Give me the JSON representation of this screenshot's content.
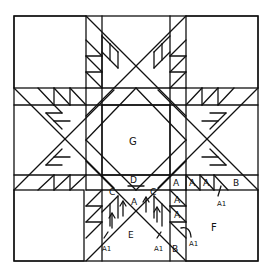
{
  "diagram": {
    "stroke_color": "#111111",
    "background": "#ffffff",
    "labels": {
      "center": "G",
      "top_triangle": "D",
      "left_c": "C",
      "right_c": "C",
      "center_a": "A",
      "e": "E",
      "f": "F",
      "row_a1": "A",
      "row_a2": "A",
      "row_a3": "A",
      "row_b": "B",
      "col_a1": "A",
      "col_a2": "A",
      "col_b": "B",
      "a1_right_row": "A1",
      "a1_right_col": "A1",
      "a1_left_arm": "A1",
      "a1_right_arm": "A1"
    }
  }
}
